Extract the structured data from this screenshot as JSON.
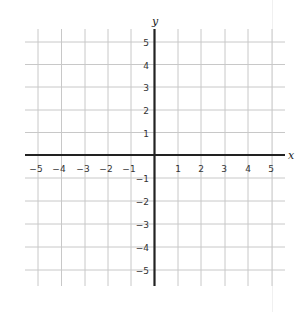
{
  "diagram": {
    "type": "coordinate-plane",
    "x_axis_label": "x",
    "y_axis_label": "y",
    "x_range": [
      -5,
      5
    ],
    "y_range": [
      -5,
      5
    ],
    "x_ticks": [
      "−5",
      "−4",
      "−3",
      "−2",
      "−1",
      "1",
      "2",
      "3",
      "4",
      "5"
    ],
    "y_ticks": [
      "5",
      "4",
      "3",
      "2",
      "1",
      "−1",
      "−2",
      "−3",
      "−4",
      "−5"
    ],
    "grid_spacing": 1,
    "colors": {
      "grid": "#c8c8c8",
      "axis": "#222222",
      "label": "#333333"
    }
  }
}
